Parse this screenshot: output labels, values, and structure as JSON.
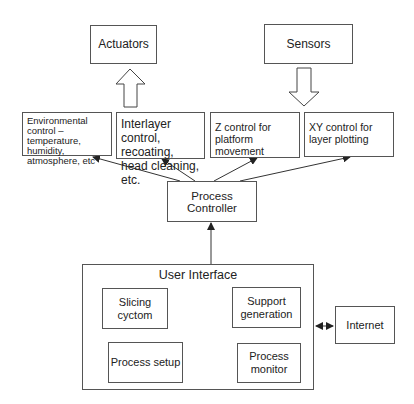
{
  "diagram": {
    "top": {
      "actuators": "Actuators",
      "sensors": "Sensors"
    },
    "controls": [
      {
        "label": "Environmental control – temperature, humidity, atmosphere, etc"
      },
      {
        "label": "Interlayer control, recoating, head cleaning, etc."
      },
      {
        "label": "Z control for platform movement"
      },
      {
        "label": "XY control for layer plotting"
      }
    ],
    "process_controller": "Process Controller",
    "user_interface": {
      "title": "User Interface",
      "modules": [
        {
          "label": "Slicing cyctom"
        },
        {
          "label": "Support generation"
        },
        {
          "label": "Process setup"
        },
        {
          "label": "Process monitor"
        }
      ]
    },
    "internet": "Internet",
    "line_color": "#333333"
  }
}
